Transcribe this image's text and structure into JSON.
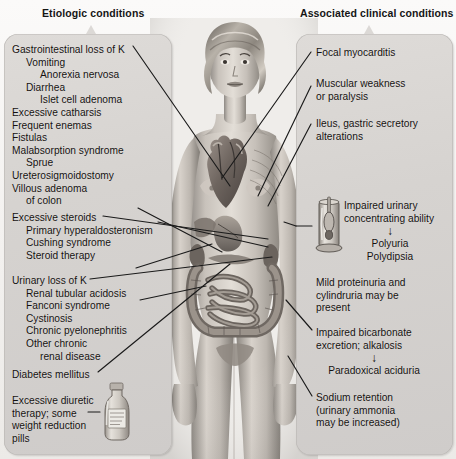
{
  "diagram": {
    "figure_alt": "Anterior view of a female figure with heart, kidneys, pancreas, stomach and intestines exposed"
  },
  "headers": {
    "left": "Etiologic conditions",
    "right": "Associated clinical conditions"
  },
  "left_panel": {
    "groups": [
      {
        "name": "gastrointestinal-loss",
        "lines": [
          {
            "text": "Gastrointestinal loss of K",
            "indent": 0
          },
          {
            "text": "Vomiting",
            "indent": 1
          },
          {
            "text": "Anorexia nervosa",
            "indent": 2
          },
          {
            "text": "Diarrhea",
            "indent": 1
          },
          {
            "text": "Islet cell adenoma",
            "indent": 2
          },
          {
            "text": "Excessive catharsis",
            "indent": 0
          },
          {
            "text": "Frequent enemas",
            "indent": 0
          },
          {
            "text": "Fistulas",
            "indent": 0
          },
          {
            "text": "Malabsorption syndrome",
            "indent": 0
          },
          {
            "text": "Sprue",
            "indent": 1
          },
          {
            "text": "Ureterosigmoidostomy",
            "indent": 0
          },
          {
            "text": "Villous adenoma",
            "indent": 0
          },
          {
            "text": "of colon",
            "indent": 1
          }
        ]
      },
      {
        "name": "excessive-steroids",
        "lines": [
          {
            "text": "Excessive steroids",
            "indent": 0
          },
          {
            "text": "Primary hyperaldosteronism",
            "indent": 1
          },
          {
            "text": "Cushing syndrome",
            "indent": 1
          },
          {
            "text": "Steroid therapy",
            "indent": 1
          }
        ]
      },
      {
        "name": "urinary-loss",
        "lines": [
          {
            "text": "Urinary loss of K",
            "indent": 0
          },
          {
            "text": "Renal tubular acidosis",
            "indent": 1
          },
          {
            "text": "Fanconi syndrome",
            "indent": 1
          },
          {
            "text": "Cystinosis",
            "indent": 1
          },
          {
            "text": "Chronic pyelonephritis",
            "indent": 1
          },
          {
            "text": "Other chronic",
            "indent": 1
          },
          {
            "text": "renal disease",
            "indent": 2
          }
        ]
      },
      {
        "name": "diabetes",
        "lines": [
          {
            "text": "Diabetes mellitus",
            "indent": 0
          }
        ]
      },
      {
        "name": "diuretic-therapy",
        "lines": [
          {
            "text": "Excessive diuretic",
            "indent": 0
          },
          {
            "text": "therapy; some",
            "indent": 0
          },
          {
            "text": "weight reduction",
            "indent": 0
          },
          {
            "text": "pills",
            "indent": 0
          }
        ]
      }
    ]
  },
  "right_panel": {
    "items": [
      {
        "name": "focal-myocarditis",
        "lines": [
          "Focal myocarditis"
        ]
      },
      {
        "name": "muscular-weakness",
        "lines": [
          "Muscular weakness",
          "or paralysis"
        ]
      },
      {
        "name": "ileus-gastric",
        "lines": [
          "Ileus, gastric secretory",
          "alterations"
        ]
      },
      {
        "name": "impaired-urinary-concentrating",
        "lines": [
          "Impaired urinary",
          "concentrating ability"
        ],
        "arrow": "↓",
        "consequences": [
          "Polyuria",
          "Polydipsia"
        ]
      },
      {
        "name": "mild-proteinuria",
        "lines": [
          "Mild proteinuria and",
          "cylindruria may be",
          "present"
        ]
      },
      {
        "name": "impaired-bicarbonate",
        "lines": [
          "Impaired bicarbonate",
          "excretion; alkalosis"
        ],
        "arrow": "↓",
        "consequences": [
          "Paradoxical aciduria"
        ]
      },
      {
        "name": "sodium-retention",
        "lines": [
          "Sodium retention",
          "(urinary ammonia",
          "may be increased)"
        ]
      }
    ]
  },
  "icons": {
    "bottle": "medicine-bottle-icon",
    "urinometer": "urinometer-icon"
  },
  "colors": {
    "panel_fill": "#d8d5d2",
    "panel_border": "#b9b6b3",
    "text": "#14110f",
    "background": "#f2f0ee",
    "leader_line": "#1a1a1a"
  }
}
